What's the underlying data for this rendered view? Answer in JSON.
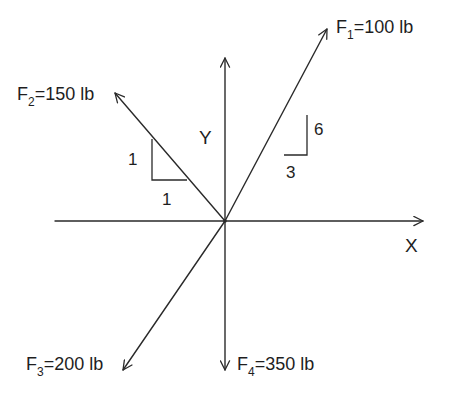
{
  "diagram": {
    "type": "force-vector-diagram",
    "axes": {
      "x_label": "X",
      "y_label": "Y"
    },
    "forces": [
      {
        "id": "F1",
        "name": "F",
        "subscript": "1",
        "value_text": "=100 lb",
        "magnitude": 100,
        "unit": "lb",
        "direction": "up-right",
        "slope": {
          "rise": "6",
          "run": "3"
        }
      },
      {
        "id": "F2",
        "name": "F",
        "subscript": "2",
        "value_text": "=150 lb",
        "magnitude": 150,
        "unit": "lb",
        "direction": "up-left",
        "slope": {
          "rise": "1",
          "run": "1"
        }
      },
      {
        "id": "F3",
        "name": "F",
        "subscript": "3",
        "value_text": "=200 lb",
        "magnitude": 200,
        "unit": "lb",
        "direction": "down-left"
      },
      {
        "id": "F4",
        "name": "F",
        "subscript": "4",
        "value_text": "=350 lb",
        "magnitude": 350,
        "unit": "lb",
        "direction": "down"
      }
    ],
    "colors": {
      "line": "#2a2a2a",
      "text": "#1e1e1e",
      "background": "#ffffff"
    }
  }
}
